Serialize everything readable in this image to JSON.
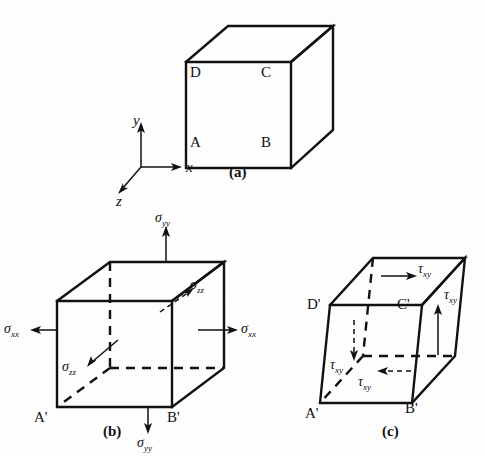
{
  "figure": {
    "panels": [
      {
        "id": "a",
        "caption": "(a)",
        "description": "Unstressed cubic element",
        "vertices": [
          "D",
          "C",
          "A",
          "B"
        ]
      },
      {
        "id": "b",
        "caption": "(b)",
        "description": "Cubic element with normal stresses",
        "vertices": [
          "A'",
          "B'"
        ],
        "stresses": [
          "σyy",
          "σyy",
          "σxx",
          "σxx",
          "σzz",
          "σzz"
        ]
      },
      {
        "id": "c",
        "caption": "(c)",
        "description": "Sheared element with shear stresses",
        "vertices": [
          "D'",
          "C'",
          "A'",
          "B'"
        ],
        "stresses": [
          "τxy",
          "τxy",
          "τxy",
          "τxy"
        ]
      }
    ],
    "axes": {
      "y": "y",
      "x": "x",
      "z": "z"
    },
    "vertex_labels": {
      "a_top_left": "D",
      "a_top_right": "C",
      "a_bottom_left": "A",
      "a_bottom_right": "B",
      "b_bottom_left": "A'",
      "b_bottom_right": "B'",
      "c_top_left": "D'",
      "c_top_right": "C'",
      "c_bottom_left": "A'",
      "c_bottom_right": "B'"
    },
    "stress_symbols": {
      "sigma_yy_top": "σ",
      "sigma_yy_top_sub": "yy",
      "sigma_yy_bottom": "σ",
      "sigma_yy_bottom_sub": "yy",
      "sigma_xx_left": "σ",
      "sigma_xx_left_sub": "xx",
      "sigma_xx_right": "σ",
      "sigma_xx_right_sub": "xx",
      "sigma_zz_outer": "σ",
      "sigma_zz_outer_sub": "zz",
      "sigma_zz_inner": "σ",
      "sigma_zz_inner_sub": "zz",
      "tau_xy_top": "τ",
      "tau_xy_top_sub": "xy",
      "tau_xy_right": "τ",
      "tau_xy_right_sub": "xy",
      "tau_xy_left": "τ",
      "tau_xy_left_sub": "xy",
      "tau_xy_bottom": "τ",
      "tau_xy_bottom_sub": "xy"
    },
    "captions": {
      "a": "(a)",
      "b": "(b)",
      "c": "(c)"
    },
    "colors": {
      "ink": "#111111",
      "background": "#fdfdfd"
    }
  }
}
